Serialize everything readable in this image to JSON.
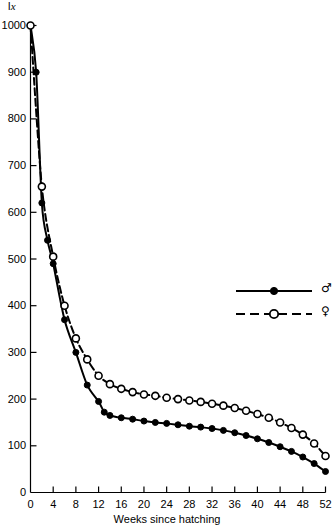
{
  "chart_data": {
    "type": "line",
    "title": "",
    "ylabel": "lx",
    "ylabel_parts": {
      "prefix": "l",
      "subscript_italic": "x"
    },
    "xlabel": "Weeks since hatching",
    "xlim": [
      0,
      52
    ],
    "ylim": [
      0,
      1000
    ],
    "xticks": [
      0,
      4,
      8,
      12,
      16,
      20,
      24,
      28,
      32,
      36,
      40,
      44,
      48,
      52
    ],
    "yticks": [
      0,
      100,
      200,
      300,
      400,
      500,
      600,
      700,
      800,
      900,
      1000
    ],
    "xtick_labels": [
      "0",
      "4",
      "8",
      "12",
      "16",
      "20",
      "24",
      "28",
      "32",
      "36",
      "40",
      "44",
      "48",
      "52"
    ],
    "ytick_labels": [
      "0",
      "100",
      "200",
      "300",
      "400",
      "500",
      "600",
      "700",
      "800",
      "900",
      "1000"
    ],
    "grid": false,
    "legend_position": "center-right",
    "series": [
      {
        "name": "male",
        "symbol": "♂",
        "line_style": "solid",
        "marker": "filled-circle",
        "color": "#000000",
        "x": [
          0,
          1,
          2,
          3,
          4,
          6,
          8,
          10,
          12,
          13,
          14,
          16,
          18,
          20,
          22,
          24,
          26,
          28,
          30,
          32,
          34,
          36,
          38,
          40,
          42,
          44,
          46,
          48,
          50,
          52
        ],
        "values": [
          1000,
          900,
          620,
          540,
          490,
          370,
          300,
          230,
          195,
          172,
          165,
          160,
          157,
          153,
          150,
          148,
          145,
          142,
          140,
          137,
          133,
          128,
          122,
          115,
          107,
          98,
          88,
          76,
          62,
          45
        ]
      },
      {
        "name": "female",
        "symbol": "♀",
        "line_style": "dashed",
        "marker": "open-circle",
        "color": "#000000",
        "x": [
          0,
          2,
          4,
          6,
          8,
          10,
          12,
          14,
          16,
          18,
          20,
          22,
          24,
          26,
          28,
          30,
          32,
          34,
          36,
          38,
          40,
          42,
          44,
          46,
          48,
          50,
          52
        ],
        "values": [
          1000,
          655,
          505,
          400,
          330,
          285,
          250,
          232,
          222,
          215,
          210,
          207,
          203,
          200,
          197,
          194,
          190,
          186,
          181,
          175,
          168,
          160,
          150,
          138,
          124,
          105,
          78
        ]
      }
    ],
    "legend": [
      {
        "label": "♂",
        "series": "male",
        "line_style": "solid",
        "marker": "filled-circle"
      },
      {
        "label": "♀",
        "series": "female",
        "line_style": "dashed",
        "marker": "open-circle"
      }
    ]
  }
}
